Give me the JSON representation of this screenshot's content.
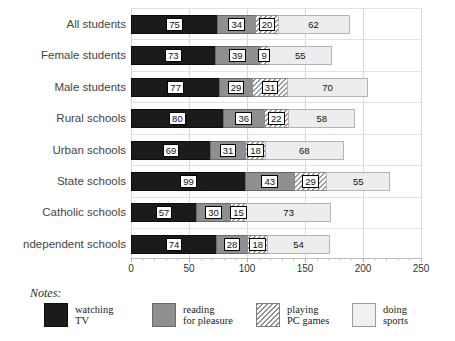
{
  "chart_data": {
    "type": "bar",
    "orientation": "horizontal",
    "stacked": true,
    "title": "",
    "xlabel": "",
    "ylabel": "",
    "xlim": [
      0,
      250
    ],
    "xticks": [
      0,
      50,
      100,
      150,
      200,
      250
    ],
    "xtick_labels": [
      "0",
      "50",
      "100",
      "150",
      "200",
      "250"
    ],
    "grid": true,
    "legend_position": "bottom",
    "categories": [
      "All students",
      "Female students",
      "Male students",
      "Rural schools",
      "Urban schools",
      "State schools",
      "Catholic schools",
      "ndependent schools"
    ],
    "series": [
      {
        "name": "watching TV",
        "key": "tv",
        "color": "#1b1b1b",
        "values": [
          75,
          73,
          77,
          80,
          69,
          99,
          57,
          74
        ]
      },
      {
        "name": "reading for pleasure",
        "key": "read",
        "color": "#8f8f8f",
        "values": [
          34,
          39,
          29,
          36,
          31,
          43,
          30,
          28
        ]
      },
      {
        "name": "playing PC games",
        "key": "games",
        "color": "hatched",
        "values": [
          20,
          9,
          31,
          22,
          18,
          29,
          15,
          18
        ]
      },
      {
        "name": "doing sports",
        "key": "sports",
        "color": "#ededed",
        "values": [
          62,
          55,
          70,
          58,
          68,
          55,
          73,
          54
        ]
      }
    ],
    "totals": [
      191,
      176,
      207,
      196,
      186,
      226,
      175,
      174
    ]
  },
  "legend": {
    "entries": [
      {
        "line1": "watching",
        "line2": "TV"
      },
      {
        "line1": "reading",
        "line2": "for pleasure"
      },
      {
        "line1": "playing",
        "line2": "PC games"
      },
      {
        "line1": "doing",
        "line2": "sports"
      }
    ]
  },
  "notes": {
    "label": "Notes:"
  }
}
